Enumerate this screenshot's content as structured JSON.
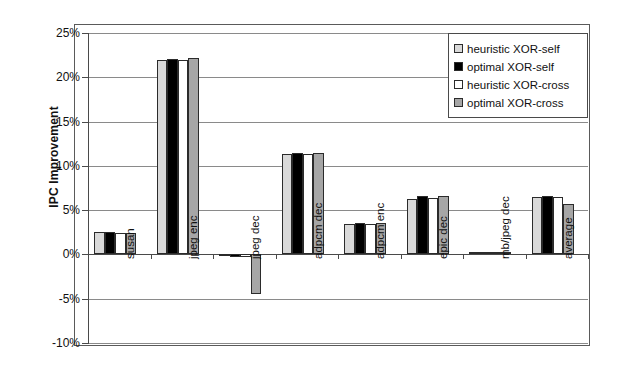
{
  "chart_data": {
    "type": "bar",
    "title": "",
    "xlabel": "",
    "ylabel": "IPC Improvement",
    "ylim": [
      -10,
      25
    ],
    "ytick_step": 5,
    "ytick_labels": [
      "25%",
      "20%",
      "15%",
      "10%",
      "5%",
      "0%",
      "-5%",
      "-10%"
    ],
    "ytick_values": [
      25,
      20,
      15,
      10,
      5,
      0,
      -5,
      -10
    ],
    "grid": true,
    "grid_axis": "y",
    "legend_position": "top-right",
    "value_format": "percent",
    "categories": [
      "susan",
      "jpeg enc",
      "jpeg dec",
      "adpcm dec",
      "adpcm enc",
      "epic dec",
      "mb/jpeg dec",
      "average"
    ],
    "series": [
      {
        "name": "heuristic XOR-self",
        "color": "#d9d9d9",
        "values": [
          2.5,
          21.9,
          -0.2,
          11.3,
          3.4,
          6.3,
          0.3,
          6.5
        ]
      },
      {
        "name": "optimal XOR-self",
        "color": "#000000",
        "values": [
          2.5,
          22.1,
          -0.3,
          11.4,
          3.5,
          6.6,
          0.3,
          6.6
        ]
      },
      {
        "name": "heuristic XOR-cross",
        "color": "#ffffff",
        "values": [
          2.4,
          22.0,
          -0.3,
          11.3,
          3.4,
          6.4,
          0.3,
          6.5
        ]
      },
      {
        "name": "optimal XOR-cross",
        "color": "#a6a6a6",
        "values": [
          2.4,
          22.2,
          -4.5,
          11.4,
          3.5,
          6.6,
          0.3,
          5.7
        ]
      }
    ]
  },
  "legend": {
    "items": [
      {
        "label": "heuristic XOR-self",
        "color": "#d9d9d9"
      },
      {
        "label": "optimal XOR-self",
        "color": "#000000"
      },
      {
        "label": "heuristic XOR-cross",
        "color": "#ffffff"
      },
      {
        "label": "optimal XOR-cross",
        "color": "#a6a6a6"
      }
    ]
  }
}
